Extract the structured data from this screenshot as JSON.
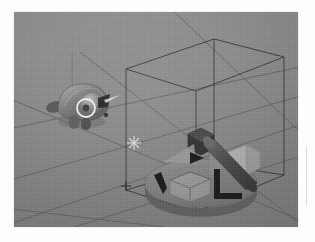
{
  "application": {
    "type": "3d-modeling-viewport",
    "render_mode": "solid-shaded",
    "color_mode": "grayscale"
  },
  "canvas": {
    "width": 315,
    "height": 242,
    "page_background": "#fdfdfd"
  },
  "viewport": {
    "x": 14,
    "y": 12,
    "width": 284,
    "height": 215,
    "background_color": "#8b8b8b",
    "grid_line_color": "#5e5e5e",
    "grid_visible": true,
    "perspective": "user-perspective"
  },
  "grid": {
    "name": "ground-plane-grid",
    "line_count": 7,
    "axis_lines": [
      "x-axis",
      "y-axis"
    ]
  },
  "cursor_3d": {
    "name": "3d-cursor",
    "x": 133,
    "y": 143,
    "glyph": "crosshair"
  },
  "objects": [
    {
      "id": "creature-mesh",
      "label": "Creature Mesh",
      "type": "organic-mesh",
      "selected": false,
      "center_x": 68,
      "center_y": 92,
      "fill": "#6f6f6f",
      "highlight": "#a9a9a9"
    },
    {
      "id": "disc-platform",
      "label": "Disc Platform",
      "type": "cylinder-disc",
      "selected": true,
      "center_x": 199,
      "center_y": 176,
      "fill": "#858585"
    },
    {
      "id": "hex-block",
      "label": "Hex Block",
      "type": "polyhedron",
      "selected": true,
      "center_x": 186,
      "center_y": 131,
      "fill": "#3b3b3b"
    },
    {
      "id": "diagonal-cylinder",
      "label": "Diagonal Cylinder",
      "type": "cylinder",
      "selected": true,
      "center_x": 212,
      "center_y": 155,
      "fill": "#555555"
    },
    {
      "id": "wireframe-cube",
      "label": "Wireframe Cube",
      "type": "cube",
      "selected": true,
      "center_x": 179,
      "center_y": 168,
      "fill": "#9a9a9a"
    },
    {
      "id": "side-block",
      "label": "Side Block",
      "type": "cube",
      "selected": true,
      "center_x": 227,
      "center_y": 148,
      "fill": "#b4b4b4"
    }
  ],
  "bounding_box": {
    "name": "selection-bounding-box",
    "visible": true,
    "line_color": "#333333",
    "object_ids": [
      "disc-platform",
      "hex-block",
      "diagonal-cylinder",
      "wireframe-cube",
      "side-block"
    ]
  },
  "gizmos": [
    {
      "id": "rotate-gizmo",
      "type": "rotation-circle",
      "attached_to": "creature-mesh",
      "center_x": 72,
      "center_y": 96,
      "radius": 9,
      "stroke": "#f2f2f2"
    },
    {
      "id": "move-gizmo",
      "type": "translate-arrows",
      "attached_to": "disc-platform",
      "arrow_color": "#1c1c1c",
      "arrow_count": 3
    }
  ],
  "decorations": {
    "right_rule_color": "#dedede"
  }
}
